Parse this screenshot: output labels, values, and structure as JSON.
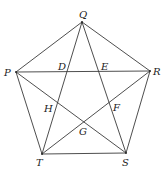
{
  "diagram": {
    "type": "pentagon-with-diagonals",
    "stroke_color": "#3a3a3a",
    "vertices": {
      "Q": {
        "x": 82,
        "y": 22
      },
      "P": {
        "x": 16,
        "y": 72
      },
      "R": {
        "x": 150,
        "y": 71
      },
      "T": {
        "x": 42,
        "y": 154
      },
      "S": {
        "x": 126,
        "y": 153
      }
    },
    "edges": [
      [
        "P",
        "Q"
      ],
      [
        "Q",
        "R"
      ],
      [
        "R",
        "S"
      ],
      [
        "S",
        "T"
      ],
      [
        "T",
        "P"
      ],
      [
        "P",
        "R"
      ],
      [
        "Q",
        "T"
      ],
      [
        "Q",
        "S"
      ],
      [
        "P",
        "S"
      ],
      [
        "R",
        "T"
      ]
    ],
    "labels": {
      "Q": {
        "text": "Q",
        "x": 79,
        "y": 18
      },
      "P": {
        "text": "P",
        "x": 4,
        "y": 76
      },
      "R": {
        "text": "R",
        "x": 153,
        "y": 75
      },
      "T": {
        "text": "T",
        "x": 36,
        "y": 166
      },
      "S": {
        "text": "S",
        "x": 122,
        "y": 166
      },
      "D": {
        "text": "D",
        "x": 58,
        "y": 70
      },
      "E": {
        "text": "E",
        "x": 101,
        "y": 70
      },
      "H": {
        "text": "H",
        "x": 44,
        "y": 112
      },
      "F": {
        "text": "F",
        "x": 113,
        "y": 111
      },
      "G": {
        "text": "G",
        "x": 79,
        "y": 135
      }
    }
  }
}
